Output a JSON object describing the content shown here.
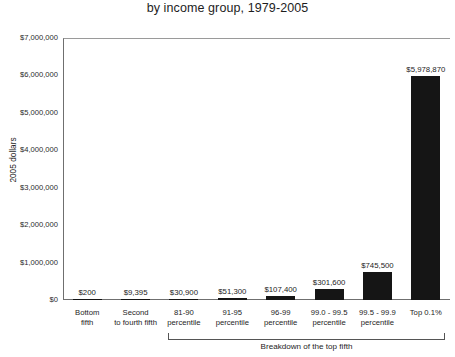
{
  "chart_data": {
    "type": "bar",
    "title": "by income group, 1979-2005",
    "xlabel": "",
    "ylabel": "2005 dollars",
    "ylim": [
      0,
      7000000
    ],
    "grid": false,
    "legend": null,
    "categories": [
      "Bottom fifth",
      "Second to fourth fifth",
      "81-90 percentile",
      "91-95 percentile",
      "96-99 percentile",
      "99.0 - 99.5 percentile",
      "99.5 - 99.9 percentile",
      "Top 0.1%"
    ],
    "values": [
      200,
      9395,
      30900,
      51300,
      107400,
      301600,
      745500,
      5978870
    ],
    "value_labels": [
      "$200",
      "$9,395",
      "$30,900",
      "$51,300",
      "$107,400",
      "$301,600",
      "$745,500",
      "$5,978,870"
    ],
    "y_ticks": [
      0,
      1000000,
      2000000,
      3000000,
      4000000,
      5000000,
      6000000,
      7000000
    ],
    "y_tick_labels": [
      "$0",
      "$1,000,000",
      "$2,000,000",
      "$3,000,000",
      "$4,000,000",
      "$5,000,000",
      "$6,000,000",
      "$7,000,000"
    ],
    "annotations": [
      {
        "text": "Breakdown of the top fifth",
        "type": "bracket",
        "spans_categories": [
          "81-90 percentile",
          "Top 0.1%"
        ]
      }
    ],
    "bar_color": "#151515"
  },
  "axis": {
    "y_title": "2005 dollars"
  },
  "x_categories": [
    {
      "line1": "Bottom",
      "line2": "fifth"
    },
    {
      "line1": "Second",
      "line2": "to fourth fifth"
    },
    {
      "line1": "81-90",
      "line2": "percentile"
    },
    {
      "line1": "91-95",
      "line2": "percentile"
    },
    {
      "line1": "96-99",
      "line2": "percentile"
    },
    {
      "line1": "99.0 - 99.5",
      "line2": "percentile"
    },
    {
      "line1": "99.5 - 99.9",
      "line2": "percentile"
    },
    {
      "line1": "Top 0.1%",
      "line2": ""
    }
  ],
  "bracket": {
    "label": "Breakdown of the top fifth"
  }
}
